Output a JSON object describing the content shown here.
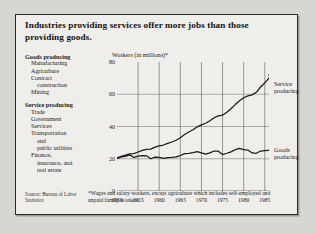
{
  "figure": {
    "title": "Industries providing services offer more jobs than those providing goods.",
    "axis_title": "Workers (in millions)*",
    "source": "Source: Bureau of Labor Statistics",
    "footnote": "*Wages and salary workers, except agriculture which includes self-employed and unpaid family workers."
  },
  "categories": [
    {
      "heading": "Goods producing",
      "items": [
        {
          "text": "Manufacturing",
          "indent": 1
        },
        {
          "text": "Agriculture",
          "indent": 1
        },
        {
          "text": "Contract",
          "indent": 1
        },
        {
          "text": "construction",
          "indent": 2
        },
        {
          "text": "Mining",
          "indent": 1
        }
      ]
    },
    {
      "heading": "Service producing",
      "items": [
        {
          "text": "Trade",
          "indent": 1
        },
        {
          "text": "Government",
          "indent": 1
        },
        {
          "text": "Services",
          "indent": 1
        },
        {
          "text": "Transportation",
          "indent": 1
        },
        {
          "text": "and",
          "indent": 2
        },
        {
          "text": "public utilities",
          "indent": 2
        },
        {
          "text": "Finance,",
          "indent": 1
        },
        {
          "text": "insurance, and",
          "indent": 2
        },
        {
          "text": "real estate",
          "indent": 2
        }
      ]
    }
  ],
  "series_labels": {
    "service": "Service\nproducing",
    "service_line1": "Service",
    "service_line2": "producing",
    "goods_line1": "Goods",
    "goods_line2": "producing"
  },
  "chart_data": {
    "type": "line",
    "title": "Industries providing services offer more jobs than those providing goods.",
    "xlabel": "",
    "ylabel": "Workers (in millions)*",
    "xlim": [
      1950,
      1986
    ],
    "ylim": [
      0,
      80
    ],
    "yticks": [
      0,
      20,
      40,
      60,
      80
    ],
    "xticks": [
      1950,
      1955,
      1960,
      1965,
      1970,
      1975,
      1980,
      1985
    ],
    "grid": true,
    "legend_position": "right-inline",
    "x": [
      1950,
      1951,
      1952,
      1953,
      1954,
      1955,
      1956,
      1957,
      1958,
      1959,
      1960,
      1961,
      1962,
      1963,
      1964,
      1965,
      1966,
      1967,
      1968,
      1969,
      1970,
      1971,
      1972,
      1973,
      1974,
      1975,
      1976,
      1977,
      1978,
      1979,
      1980,
      1981,
      1982,
      1983,
      1984,
      1985,
      1986
    ],
    "series": [
      {
        "name": "Service producing",
        "values": [
          20.5,
          21.5,
          22.3,
          23.0,
          23.2,
          24.2,
          25.2,
          25.8,
          26.0,
          27.2,
          28.0,
          28.5,
          29.5,
          30.4,
          31.5,
          33.0,
          35.0,
          36.6,
          38.0,
          39.8,
          41.0,
          42.0,
          43.6,
          45.4,
          46.6,
          47.0,
          48.8,
          51.0,
          53.6,
          56.0,
          57.8,
          59.0,
          59.6,
          61.2,
          64.5,
          67.0,
          70.0
        ],
        "style": "solid",
        "color": "#1a1a1a",
        "projection_tail": {
          "x": [
            1986,
            1987
          ],
          "values": [
            73.0,
            75.5
          ],
          "style": "dotted"
        }
      },
      {
        "name": "Goods producing",
        "values": [
          20.0,
          21.2,
          21.5,
          22.4,
          20.8,
          21.6,
          22.0,
          21.8,
          20.0,
          21.0,
          20.8,
          20.2,
          20.7,
          20.9,
          21.2,
          22.0,
          23.2,
          23.4,
          23.8,
          24.4,
          23.6,
          22.9,
          23.6,
          24.8,
          24.7,
          22.6,
          23.4,
          24.3,
          25.6,
          26.4,
          25.6,
          25.4,
          23.6,
          23.4,
          24.8,
          25.0,
          25.2
        ],
        "style": "solid",
        "color": "#1a1a1a",
        "projection_tail": {
          "x": [
            1986,
            1987
          ],
          "values": [
            26.0,
            27.0
          ],
          "style": "dotted"
        }
      }
    ]
  }
}
